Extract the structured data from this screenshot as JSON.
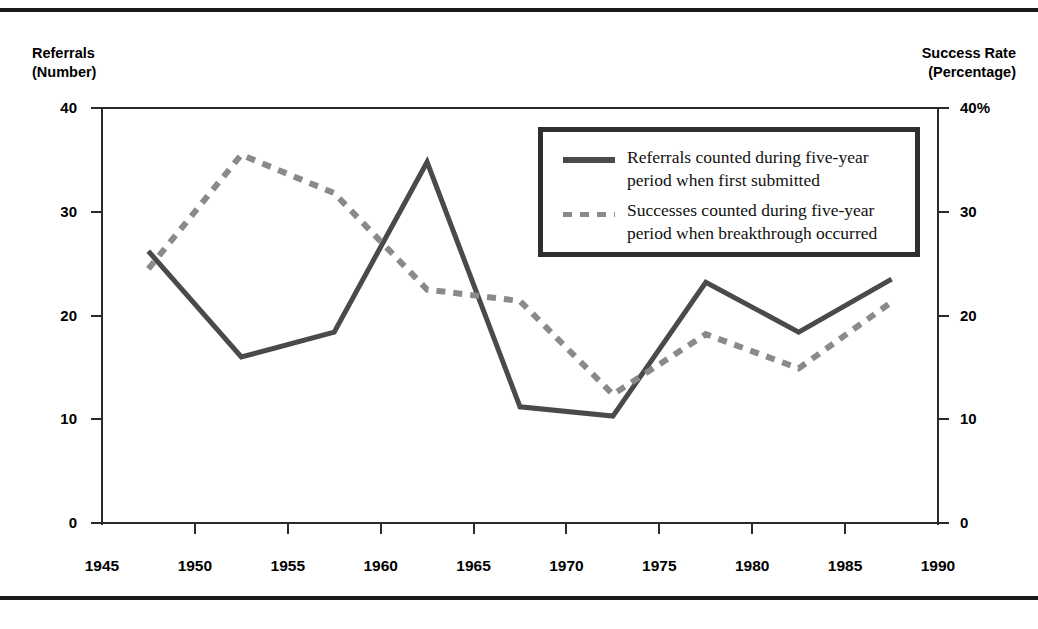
{
  "figure": {
    "left_axis_title": "Referrals\n(Number)",
    "right_axis_title": "Success Rate\n(Percentage)"
  },
  "legend": {
    "items": [
      {
        "style": "solid",
        "label": "Referrals counted during five-year\nperiod when first submitted"
      },
      {
        "style": "dashed",
        "label": "Successes counted during five-year\nperiod when breakthrough occurred"
      }
    ]
  },
  "colors": {
    "solid_series": "#4a4a4a",
    "dashed_series": "#8a8a8a",
    "axis": "#2b2b2b",
    "rule": "#1a1a1a",
    "text": "#000000",
    "background": "#ffffff"
  },
  "axes": {
    "left_ticks": [
      "40",
      "30",
      "20",
      "10",
      "0"
    ],
    "right_ticks": [
      "40%",
      "30",
      "20",
      "10",
      "0"
    ],
    "x_ticks": [
      "1945",
      "1950",
      "1955",
      "1960",
      "1965",
      "1970",
      "1975",
      "1980",
      "1985",
      "1990"
    ]
  },
  "chart_data": {
    "type": "line",
    "title": "",
    "xlabel": "",
    "ylabel": "Referrals (Number)",
    "y2label": "Success Rate (Percentage)",
    "xlim": [
      1945,
      1990
    ],
    "ylim": [
      0,
      40
    ],
    "y2lim": [
      0,
      40
    ],
    "grid": false,
    "legend_position": "upper-right-inset",
    "x": [
      1947.5,
      1952.5,
      1957.5,
      1962.5,
      1967.5,
      1972.5,
      1977.5,
      1982.5,
      1987.5
    ],
    "series": [
      {
        "name": "Referrals counted during five-year period when first submitted",
        "axis": "left",
        "style": "solid",
        "color": "#4a4a4a",
        "x": [
          1947.5,
          1952.5,
          1957.5,
          1962.5,
          1967.5,
          1972.5,
          1977.5,
          1982.5,
          1987.5
        ],
        "values": [
          26.2,
          16.0,
          18.4,
          34.8,
          11.2,
          10.3,
          23.2,
          18.4,
          23.5
        ]
      },
      {
        "name": "Successes counted during five-year period when breakthrough occurred",
        "axis": "right",
        "style": "dashed",
        "color": "#8a8a8a",
        "x": [
          1947.5,
          1952.5,
          1957.5,
          1962.5,
          1967.5,
          1972.5,
          1977.5,
          1982.5,
          1987.5
        ],
        "values": [
          24.5,
          35.5,
          31.8,
          22.5,
          21.4,
          12.4,
          18.2,
          14.9,
          21.3
        ]
      }
    ]
  }
}
